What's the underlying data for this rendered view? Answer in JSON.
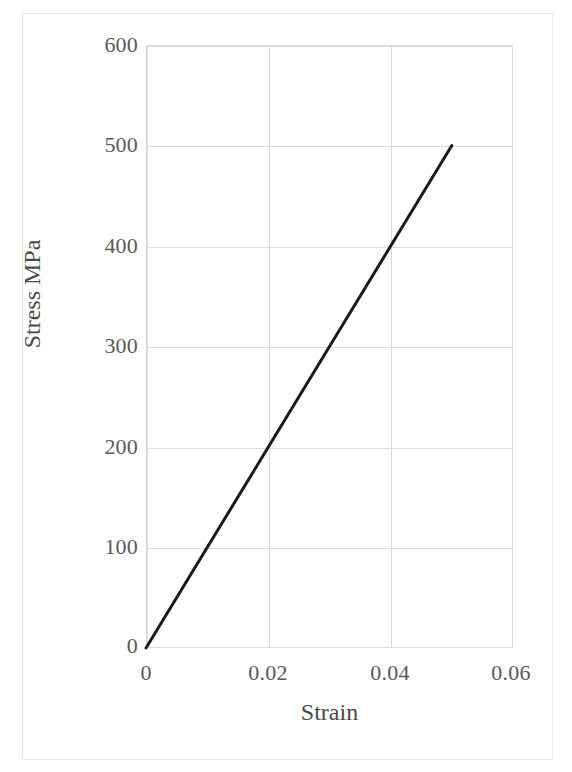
{
  "figure": {
    "frame_color": "#e8e8e8",
    "background": "#ffffff"
  },
  "axis_titles": {
    "y": "Stress MPa",
    "x": "Strain"
  },
  "ticks": {
    "y": [
      "600",
      "500",
      "400",
      "300",
      "200",
      "100",
      "0"
    ],
    "x": [
      "0",
      "0.02",
      "0.04",
      "0.06"
    ]
  },
  "style": {
    "gridline_color": "#dcdcdc",
    "tick_text_color": "#595959",
    "axis_title_color": "#4a4a4a",
    "series_color": "#1a1a1a"
  },
  "chart_data": {
    "type": "line",
    "title": "",
    "subtitle": "",
    "xlabel": "Strain",
    "ylabel": "Stress MPa",
    "xlim": [
      0,
      0.06
    ],
    "ylim": [
      0,
      600
    ],
    "xticks": [
      0,
      0.02,
      0.04,
      0.06
    ],
    "yticks": [
      0,
      100,
      200,
      300,
      400,
      500,
      600
    ],
    "xtick_labels": [
      "0",
      "0.02",
      "0.04",
      "0.06"
    ],
    "ytick_labels": [
      "0",
      "100",
      "200",
      "300",
      "400",
      "500",
      "600"
    ],
    "grid": true,
    "legend": false,
    "legend_position": "none",
    "annotations": [],
    "series": [
      {
        "name": "Stress-strain",
        "color": "#1a1a1a",
        "line_width": 3,
        "marker": "none",
        "x": [
          0,
          0.01,
          0.02,
          0.03,
          0.04,
          0.05
        ],
        "y": [
          0,
          100,
          200,
          300,
          400,
          500
        ],
        "slope_mpa": 10000
      }
    ]
  }
}
